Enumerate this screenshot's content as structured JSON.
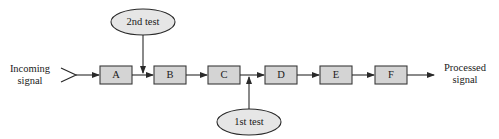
{
  "diagram": {
    "input": {
      "line1": "Incoming",
      "line2": "signal"
    },
    "output": {
      "line1": "Processed",
      "line2": "signal"
    },
    "stages": [
      {
        "id": "A",
        "label": "A"
      },
      {
        "id": "B",
        "label": "B"
      },
      {
        "id": "C",
        "label": "C"
      },
      {
        "id": "D",
        "label": "D"
      },
      {
        "id": "E",
        "label": "E"
      },
      {
        "id": "F",
        "label": "F"
      }
    ],
    "tests": [
      {
        "label": "2nd test",
        "position": "above",
        "inserted_between": [
          "A",
          "B"
        ]
      },
      {
        "label": "1st test",
        "position": "below",
        "inserted_between": [
          "C",
          "D"
        ]
      }
    ],
    "colors": {
      "box_fill": "#d4d4d4",
      "box_stroke": "#3a3a3a",
      "oval_fill": "#e6e6e6",
      "line": "#2a2a2a"
    }
  }
}
